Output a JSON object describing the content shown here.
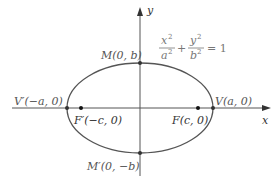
{
  "diagram": {
    "type": "ellipse-with-foci",
    "axes": {
      "x_label": "x",
      "y_label": "y"
    },
    "equation": {
      "term1_num": "x",
      "term1_den": "a",
      "term2_num": "y",
      "term2_den": "b",
      "exp": "2",
      "plus": "+",
      "rhs": "= 1"
    },
    "points": {
      "M": "M(0, b)",
      "M_prime": "M′(0, −b)",
      "V": "V(a, 0)",
      "V_prime": "V′(−a, 0)",
      "F": "F(c, 0)",
      "F_prime": "F′(−c, 0)"
    },
    "colors": {
      "stroke": "#555555",
      "text": "#666666",
      "dot": "#222222"
    }
  }
}
